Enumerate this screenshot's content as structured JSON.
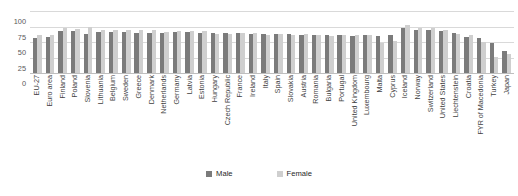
{
  "chart_data": {
    "type": "bar",
    "title": "",
    "subtitle": "",
    "xlabel": "",
    "ylabel": "",
    "ylim": [
      0,
      100
    ],
    "yticks": [
      0,
      25,
      50,
      75,
      100
    ],
    "grid": true,
    "legend_position": "bottom",
    "categories": [
      "EU-27",
      "Euro area",
      "Finland",
      "Poland",
      "Slovenia",
      "Lithuania",
      "Belgium",
      "Sweden",
      "Greece",
      "Denmark",
      "Netherlands",
      "Germany",
      "Latvia",
      "Estonia",
      "Hungary",
      "Czech Republic",
      "France",
      "Ireland",
      "Italy",
      "Spain",
      "Slovakia",
      "Austria",
      "Romania",
      "Bulgaria",
      "Portugal",
      "United Kingdom",
      "Luxembourg",
      "Malta",
      "Cyprus",
      "Iceland",
      "Norway",
      "Switzerland",
      "United States",
      "Liechtenstein",
      "Croatia",
      "FYR of Macedonia",
      "Turkey",
      "Japan"
    ],
    "series": [
      {
        "name": "Male",
        "color": "#7b7b7b",
        "values": [
          57,
          58,
          68,
          67,
          63,
          66,
          66,
          66,
          65,
          64,
          65,
          66,
          66,
          65,
          64,
          65,
          64,
          63,
          63,
          63,
          63,
          62,
          62,
          61,
          61,
          60,
          61,
          60,
          61,
          72,
          70,
          69,
          68,
          65,
          58,
          56,
          48,
          36
        ]
      },
      {
        "name": "Female",
        "color": "#cfcfcf",
        "values": [
          61,
          61,
          72,
          71,
          74,
          70,
          69,
          70,
          70,
          70,
          66,
          67,
          67,
          67,
          63,
          63,
          65,
          64,
          62,
          63,
          62,
          63,
          61,
          60,
          62,
          62,
          62,
          49,
          52,
          78,
          72,
          73,
          70,
          63,
          61,
          50,
          26,
          31
        ]
      }
    ]
  },
  "legend": {
    "items": [
      {
        "label": "Male",
        "color": "#7b7b7b"
      },
      {
        "label": "Female",
        "color": "#cfcfcf"
      }
    ]
  }
}
